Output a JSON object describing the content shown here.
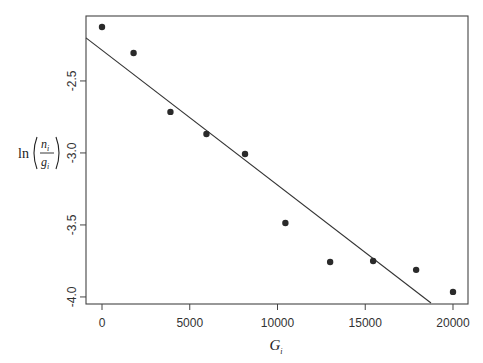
{
  "chart_data": {
    "type": "scatter",
    "title": "",
    "xlabel": "G_i",
    "ylabel": "ln(n_i / g_i)",
    "xlim": [
      -912,
      20855
    ],
    "ylim": [
      -4.049,
      -2.049
    ],
    "grid": false,
    "legend": null,
    "x_ticks": [
      0,
      5000,
      10000,
      15000,
      20000
    ],
    "x_tick_labels": [
      "0",
      "5000",
      "10000",
      "15000",
      "20000"
    ],
    "y_ticks": [
      -2.5,
      -3.0,
      -3.5,
      -4.0
    ],
    "y_tick_labels": [
      "-2.5",
      "-3.0",
      "-3.5",
      "-4.0"
    ],
    "series": [
      {
        "name": "observations",
        "marker": "filled-circle",
        "x": [
          0,
          1800,
          3900,
          5950,
          8150,
          10450,
          13000,
          15450,
          17900,
          20000
        ],
        "y": [
          -2.125,
          -2.306,
          -2.715,
          -2.868,
          -3.007,
          -3.486,
          -3.757,
          -3.75,
          -3.812,
          -3.965
        ]
      }
    ],
    "fit_line": {
      "name": "least-squares fit",
      "intercept": -2.286,
      "slope": -9.37e-05,
      "x_start": -912,
      "y_start": -2.201,
      "x_end": 18746,
      "y_end": -4.042
    }
  },
  "labels": {
    "x_axis_main": "G",
    "x_axis_sub": "i",
    "y_axis_ln": "ln",
    "y_axis_num": "n",
    "y_axis_num_sub": "i",
    "y_axis_den": "g",
    "y_axis_den_sub": "i"
  },
  "colors": {
    "points": "#2a2a2a",
    "line": "#333333",
    "frame": "#444444"
  }
}
